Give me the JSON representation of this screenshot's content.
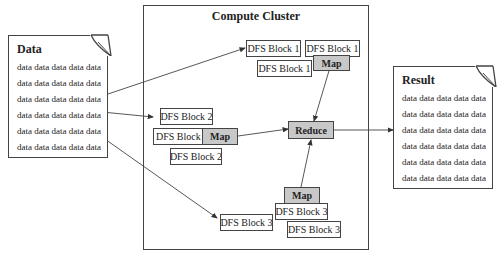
{
  "cluster": {
    "title": "Compute Cluster"
  },
  "input_doc": {
    "title": "Data",
    "lines": [
      "data data data data data",
      "data data data data data",
      "data data data data data",
      "data data data data data",
      "data data data data data",
      "data data data data data"
    ]
  },
  "output_doc": {
    "title": "Result",
    "lines": [
      "data data data data data",
      "data data data data data",
      "data data data data data",
      "data data data data data",
      "data data data data data",
      "data data data data data"
    ]
  },
  "blocks": {
    "b1a": "DFS Block 1",
    "b1b": "DFS Block 1",
    "b1c": "DFS Block 1",
    "b2a": "DFS Block 2",
    "b2b": "DFS Block 2",
    "b2c": "DFS Block 2",
    "b3a": "DFS Block 3",
    "b3b": "DFS Block 3",
    "b3c": "DFS Block 3"
  },
  "ops": {
    "map1": "Map",
    "map2": "Map",
    "map3": "Map",
    "reduce": "Reduce"
  },
  "colors": {
    "op_fill": "#c8c8c8",
    "border": "#444444"
  }
}
